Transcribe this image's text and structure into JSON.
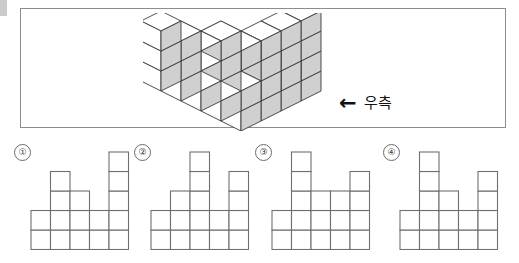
{
  "page": {
    "kind": "spatial-reasoning-question",
    "background_color": "#ffffff",
    "ink_color": "#1a1a1a"
  },
  "figure_panel": {
    "border_color": "#8d8d8d",
    "fill_color": "#ffffff",
    "direction_label": {
      "arrow_icon": "left-arrow-icon",
      "arrow_glyph": "←",
      "text": "우측"
    },
    "solid": {
      "type": "isometric-cube-stack",
      "face_colors": {
        "top": "#ffffff",
        "left": "#ffffff",
        "right": "#d0d0d0",
        "outline": "#3a3a3a"
      },
      "grid_rows": 4,
      "grid_cols": 5,
      "heights": [
        [
          1,
          1,
          1,
          1,
          4
        ],
        [
          1,
          1,
          2,
          1,
          4
        ],
        [
          2,
          1,
          3,
          1,
          4
        ],
        [
          3,
          3,
          1,
          1,
          2
        ]
      ]
    }
  },
  "options": [
    {
      "marker": "①",
      "name": "option-1",
      "columns": 5,
      "heights": [
        2,
        4,
        3,
        2,
        5
      ]
    },
    {
      "marker": "②",
      "name": "option-2",
      "columns": 5,
      "heights": [
        2,
        3,
        5,
        2,
        4
      ]
    },
    {
      "marker": "③",
      "name": "option-3",
      "columns": 5,
      "heights": [
        2,
        5,
        3,
        3,
        4
      ]
    },
    {
      "marker": "④",
      "name": "option-4",
      "columns": 5,
      "heights": [
        2,
        5,
        3,
        2,
        4
      ]
    }
  ]
}
